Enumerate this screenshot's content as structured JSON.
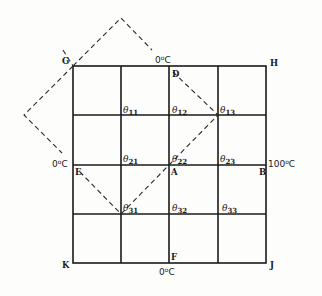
{
  "diagram": {
    "type": "heat-conduction-grid",
    "grid": {
      "rows": 4,
      "cols": 4
    },
    "corners": {
      "G": "G",
      "H": "H",
      "K": "K",
      "J": "J"
    },
    "points": {
      "D": "D",
      "E": "E",
      "A": "A",
      "B": "B",
      "F": "F"
    },
    "nodes": [
      {
        "id": "θ11",
        "base": "θ",
        "sub": "11"
      },
      {
        "id": "θ12",
        "base": "θ",
        "sub": "12"
      },
      {
        "id": "θ13",
        "base": "θ",
        "sub": "13"
      },
      {
        "id": "θ21",
        "base": "θ",
        "sub": "21"
      },
      {
        "id": "θ22",
        "base": "θ",
        "sub": "22"
      },
      {
        "id": "θ23",
        "base": "θ",
        "sub": "23"
      },
      {
        "id": "θ31",
        "base": "θ",
        "sub": "31"
      },
      {
        "id": "θ32",
        "base": "θ",
        "sub": "32"
      },
      {
        "id": "θ33",
        "base": "θ",
        "sub": "33"
      }
    ],
    "boundaries": {
      "top": {
        "value": "0",
        "unit": "C"
      },
      "left": {
        "value": "0",
        "unit": "C"
      },
      "right": {
        "value": "100",
        "unit": "C"
      },
      "bottom": {
        "value": "0",
        "unit": "C"
      }
    },
    "degree_symbol": "o"
  }
}
